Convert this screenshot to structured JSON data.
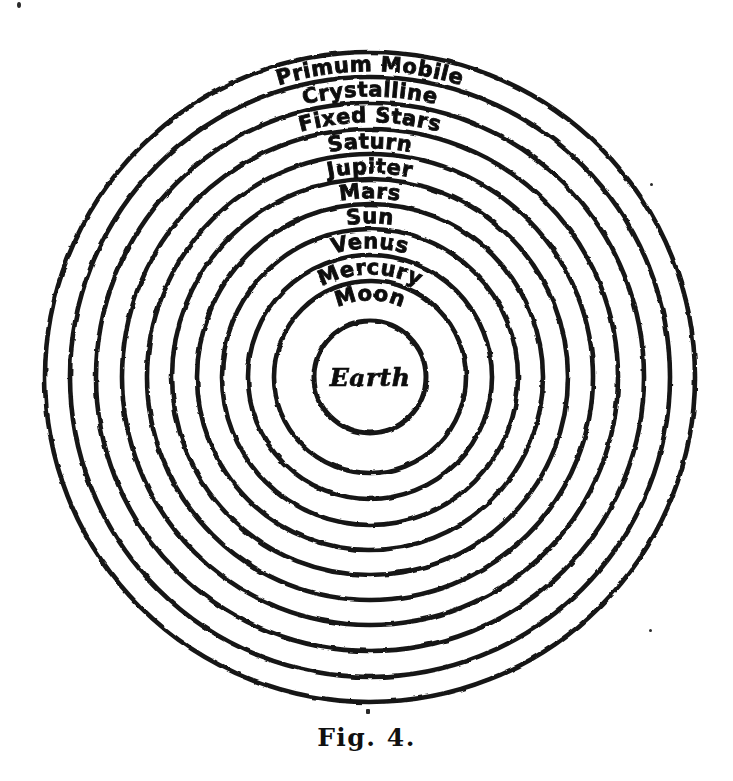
{
  "figure": {
    "caption": "Fig. 4.",
    "center_label": "Earth",
    "ink_color": "#151515",
    "background_color": "#ffffff",
    "center_x": 370,
    "center_y": 377,
    "ring_count": 11
  },
  "spheres": [
    {
      "label": "Primum Mobile",
      "radius": 325,
      "order": 1,
      "label_font_size": 21
    },
    {
      "label": "Crystalline",
      "radius": 300,
      "order": 2,
      "label_font_size": 21
    },
    {
      "label": "Fixed Stars",
      "radius": 274,
      "order": 3,
      "label_font_size": 21
    },
    {
      "label": "Saturn",
      "radius": 248,
      "order": 4,
      "label_font_size": 21
    },
    {
      "label": "Jupiter",
      "radius": 223,
      "order": 5,
      "label_font_size": 21
    },
    {
      "label": "Mars",
      "radius": 198,
      "order": 6,
      "label_font_size": 21
    },
    {
      "label": "Sun",
      "radius": 173,
      "order": 7,
      "label_font_size": 21
    },
    {
      "label": "Venus",
      "radius": 148,
      "order": 8,
      "label_font_size": 21
    },
    {
      "label": "Mercury",
      "radius": 122,
      "order": 9,
      "label_font_size": 21
    },
    {
      "label": "Moon",
      "radius": 96,
      "order": 10,
      "label_font_size": 21
    },
    {
      "label": "",
      "radius": 56,
      "order": 11,
      "label_font_size": 0
    }
  ]
}
